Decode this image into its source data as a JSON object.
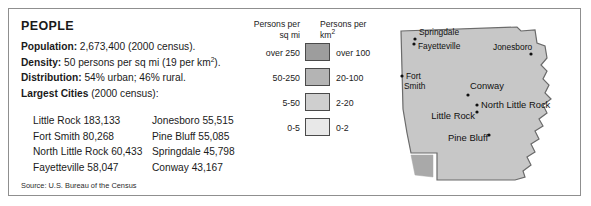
{
  "panel": {
    "title": "PEOPLE",
    "facts": [
      {
        "label": "Population:",
        "value": " 2,673,400 (2000 census)."
      },
      {
        "label": "Density:",
        "value": " 50 persons per sq mi (19 per km",
        "sup": "2",
        "tail": ")."
      },
      {
        "label": "Distribution:",
        "value": " 54% urban; 46% rural."
      },
      {
        "label": "Largest Cities",
        "value": " (2000 census):"
      }
    ],
    "cities": [
      {
        "left": "Little Rock 183,133",
        "right": "Jonesboro 55,515"
      },
      {
        "left": "Fort Smith 80,268",
        "right": "Pine Bluff 55,085"
      },
      {
        "left": "North Little Rock 60,433",
        "right": "Springdale 45,798"
      },
      {
        "left": "Fayetteville 58,047",
        "right": "Conway 43,167"
      }
    ],
    "source": "Source: U.S. Bureau of the Census"
  },
  "legend": {
    "heading_left": "Persons per\nsq mi",
    "heading_left_line1": "Persons per",
    "heading_left_line2": "sq mi",
    "heading_right_line1": "Persons per",
    "heading_right_line2": "km",
    "heading_right_sup": "2",
    "rows": [
      {
        "sq_mi": "over 250",
        "km2": "over 100",
        "color": "#9d9d9d"
      },
      {
        "sq_mi": "50-250",
        "km2": "20-100",
        "color": "#b4b4b4"
      },
      {
        "sq_mi": "5-50",
        "km2": "2-20",
        "color": "#cfcfcf"
      },
      {
        "sq_mi": "0-5",
        "km2": "0-2",
        "color": "#e8e8e8"
      }
    ]
  },
  "map": {
    "name": "arkansas-map",
    "base_fill": "#c7c7c7",
    "dense_fill": "#a9a9a9",
    "outline": "#6b6b6b",
    "cities": [
      {
        "name": "Springdale",
        "label_x": 22,
        "label_y": 22,
        "dot_x": 18,
        "dot_y": 26,
        "anchor": "start",
        "size": "normal"
      },
      {
        "name": "Fayetteville",
        "label_x": 21,
        "label_y": 36,
        "dot_x": 17,
        "dot_y": 31,
        "anchor": "start",
        "size": "normal"
      },
      {
        "name": "Jonesboro",
        "label_x": 96,
        "label_y": 37,
        "dot_x": 134,
        "dot_y": 41,
        "anchor": "start",
        "size": "normal"
      },
      {
        "name": "Fort",
        "label_x": 9,
        "label_y": 66,
        "dot_x": 5,
        "dot_y": 63,
        "anchor": "start",
        "size": "normal"
      },
      {
        "name": "Smith",
        "label_x": 7,
        "label_y": 76,
        "dot_x": -1,
        "dot_y": -1,
        "anchor": "start",
        "size": "normal"
      },
      {
        "name": "Conway",
        "label_x": 73,
        "label_y": 76,
        "dot_x": 71,
        "dot_y": 82,
        "anchor": "start",
        "size": "big"
      },
      {
        "name": "North Little Rock",
        "label_x": 84,
        "label_y": 95,
        "dot_x": 80,
        "dot_y": 92,
        "anchor": "start",
        "size": "big"
      },
      {
        "name": "Little Rock",
        "label_x": 78,
        "label_y": 106,
        "dot_x": 80,
        "dot_y": 99,
        "anchor": "end",
        "size": "big"
      },
      {
        "name": "Pine Bluff",
        "label_x": 91,
        "label_y": 128,
        "dot_x": 92,
        "dot_y": 122,
        "anchor": "end",
        "size": "big"
      }
    ]
  }
}
